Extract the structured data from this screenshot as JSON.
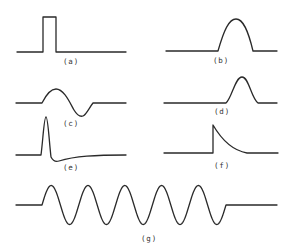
{
  "figure": {
    "panels": [
      {
        "id": "a",
        "label": "(a)",
        "shape": "rectangular-pulse",
        "path": "M17,52 L43,52 L43,17 L56,17 L56,52 L126,52",
        "label_x": 63,
        "label_y": 64
      },
      {
        "id": "b",
        "label": "(b)",
        "shape": "half-sine-pulse",
        "path": "M166,51 L218,51 C224,30 229,19 236,19 C243,19 248,30 253,51 L277,51",
        "label_x": 213,
        "label_y": 63
      },
      {
        "id": "c",
        "label": "(c)",
        "shape": "single-cycle-sine",
        "path": "M16,103 L42,103 C46,95 50,89 56,89 C64,89 70,103 74,110 C77,115 80,117 83,116 C86,115 89,108 93,103 L126,103",
        "label_x": 63,
        "label_y": 126
      },
      {
        "id": "d",
        "label": "(d)",
        "shape": "gaussian-pulse",
        "path": "M164,103 L226,103 C232,98 235,77 242,77 C249,77 251,98 258,103 L277,103",
        "label_x": 214,
        "label_y": 114
      },
      {
        "id": "e",
        "label": "(e)",
        "shape": "spike-with-undershoot",
        "path": "M16,155 L41,155 C43,140 44,117 46,117 C48,117 49,140 51,157 C53,161 56,162 59,161 C75,156 95,155 126,155",
        "label_x": 63,
        "label_y": 170
      },
      {
        "id": "f",
        "label": "(f)",
        "shape": "step-exponential-decay",
        "path": "M164,153 L213,153 L213,125 C220,137 230,150 247,153 L278,153",
        "label_x": 214,
        "label_y": 168
      },
      {
        "id": "g",
        "label": "(g)",
        "shape": "tone-burst-5-cycles",
        "path": "",
        "label_x": 141,
        "label_y": 241,
        "burst": {
          "x_start": 42,
          "x_end": 226,
          "baseline_y": 205,
          "amplitude": 19.5,
          "cycles": 5,
          "line_x_start": 16,
          "line_x_end": 277
        }
      }
    ]
  }
}
